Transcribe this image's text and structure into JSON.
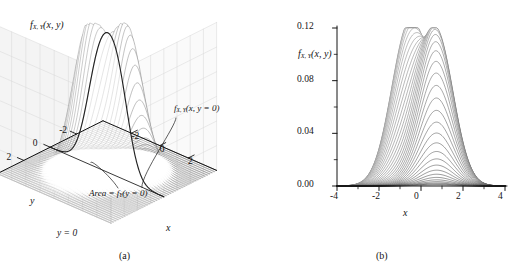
{
  "figure": {
    "background": "#ffffff",
    "ink": "#141414",
    "grid_color": "#d8d8d8",
    "panels": [
      {
        "id": "a",
        "caption": "(a)"
      },
      {
        "id": "b",
        "caption": "(b)"
      }
    ]
  },
  "panel_a": {
    "caption": "(a)",
    "zlabel": "f",
    "zlabel_sub": "X, Y",
    "zlabel_args": "(x, y)",
    "slice_label": "f",
    "slice_label_sub": "X, Y",
    "slice_label_args": "(x, y = 0)",
    "area_label_pre": "Area = f",
    "area_label_sub": "Y",
    "area_label_args": "(y = 0)",
    "plane_label": "y = 0",
    "xlabel": "x",
    "ylabel": "y",
    "z_ticks": [
      "0.12",
      "0.08",
      "0.04",
      "0.00"
    ],
    "z_tick_values": [
      0.12,
      0.08,
      0.04,
      0.0
    ],
    "z_minor_count": 1,
    "x_ticks": [
      "-2",
      "0",
      "2"
    ],
    "x_tick_values": [
      -2,
      0,
      2
    ],
    "y_ticks": [
      "2",
      "0",
      "-2"
    ],
    "y_tick_values": [
      2,
      0,
      -2
    ]
  },
  "panel_b": {
    "caption": "(b)",
    "ylabel": "f",
    "ylabel_sub": "X, Y",
    "ylabel_args": "(x, y)",
    "xlabel": "x",
    "y_ticks": [
      "0.12",
      "0.08",
      "0.04",
      "0.00"
    ],
    "y_tick_values": [
      0.12,
      0.08,
      0.04,
      0.0
    ],
    "x_ticks": [
      "-4",
      "-2",
      "0",
      "2",
      "4"
    ],
    "x_tick_values": [
      -4,
      -2,
      0,
      2,
      4
    ]
  },
  "chart_data": {
    "type": "line",
    "title": "",
    "pdf_model": {
      "components": [
        {
          "weight": 0.55,
          "mean_x": -0.55,
          "mean_y": 0.75,
          "sigma_x": 0.85,
          "sigma_y": 0.85,
          "rho": 0.0
        },
        {
          "weight": 0.45,
          "mean_x": 0.75,
          "mean_y": -0.75,
          "sigma_x": 0.8,
          "sigma_y": 0.8,
          "rho": 0.0
        }
      ]
    },
    "panel_a": {
      "type": "surface",
      "xlabel": "x",
      "ylabel": "y",
      "zlabel": "f_X,Y(x, y)",
      "xlim": [
        -4,
        4
      ],
      "ylim": [
        -4,
        4
      ],
      "zlim": [
        0,
        0.12
      ],
      "xticks": [
        -2,
        0,
        2
      ],
      "yticks": [
        -2,
        0,
        2
      ],
      "zticks": [
        0.0,
        0.04,
        0.08,
        0.12
      ],
      "grid": true,
      "mesh_lines": 46,
      "annotations": [
        {
          "text": "f_X,Y(x, y = 0)",
          "role": "highlighted-slice-callout"
        },
        {
          "text": "Area = f_Y(y = 0)",
          "role": "marginal-area-callout"
        },
        {
          "text": "y = 0",
          "role": "slice-plane-label"
        }
      ]
    },
    "panel_b": {
      "type": "line",
      "xlabel": "x",
      "ylabel": "f_X,Y(x, y)",
      "xlim": [
        -4,
        4
      ],
      "ylim": [
        0,
        0.12
      ],
      "xticks": [
        -4,
        -2,
        0,
        2,
        4
      ],
      "yticks": [
        0.0,
        0.04,
        0.08,
        0.12
      ],
      "grid": false,
      "n_curves": 60,
      "curve_family_param": "y",
      "curve_family_range": [
        -3.2,
        3.2
      ],
      "envelope_peak": {
        "x": 0.35,
        "y": 0.115
      },
      "series": [
        {
          "name": "y = -3.2",
          "peak_x": 0.75,
          "peak_y": 0.004
        },
        {
          "name": "y = -2.4",
          "peak_x": 0.75,
          "peak_y": 0.016
        },
        {
          "name": "y = -1.6",
          "peak_x": 0.72,
          "peak_y": 0.045
        },
        {
          "name": "y = -0.8",
          "peak_x": 0.65,
          "peak_y": 0.082
        },
        {
          "name": "y = 0.0",
          "peak_x": 0.3,
          "peak_y": 0.104
        },
        {
          "name": "y = 0.8",
          "peak_x": -0.45,
          "peak_y": 0.115
        },
        {
          "name": "y = 1.6",
          "peak_x": -0.55,
          "peak_y": 0.082
        },
        {
          "name": "y = 2.4",
          "peak_x": -0.55,
          "peak_y": 0.03
        },
        {
          "name": "y = 3.2",
          "peak_x": -0.55,
          "peak_y": 0.006
        }
      ]
    }
  }
}
